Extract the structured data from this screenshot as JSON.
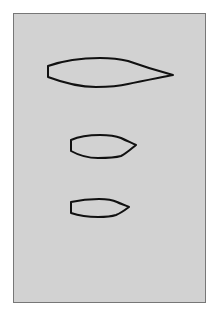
{
  "figure": {
    "background": "#ffffff",
    "panel_color": "#d2d2d2",
    "panel_border": "#777777",
    "stroke_color": "#111111",
    "shapes": [
      {
        "name": "hull-outline-large",
        "bbox": [
          47,
          58,
          173,
          87
        ]
      },
      {
        "name": "hull-outline-medium",
        "bbox": [
          70,
          135,
          136,
          158
        ]
      },
      {
        "name": "hull-outline-small",
        "bbox": [
          70,
          199,
          129,
          217
        ]
      }
    ]
  }
}
